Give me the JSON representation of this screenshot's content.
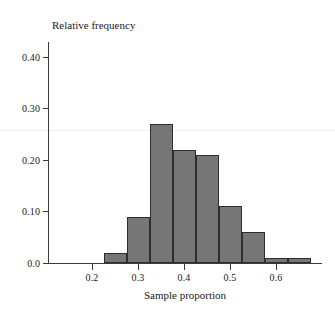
{
  "chart_data": {
    "type": "bar",
    "title": "",
    "subtitle": "",
    "xlabel": "Sample proportion",
    "ylabel": "Relative frequency",
    "xlim": [
      0.15,
      0.68
    ],
    "ylim": [
      0.0,
      0.43
    ],
    "grid": false,
    "legend": null,
    "bin_width": 0.05,
    "categories": [
      "0.225-0.275",
      "0.275-0.325",
      "0.325-0.375",
      "0.375-0.425",
      "0.425-0.475",
      "0.475-0.525",
      "0.525-0.575",
      "0.575-0.625",
      "0.625-0.675"
    ],
    "bin_starts": [
      0.225,
      0.275,
      0.325,
      0.375,
      0.425,
      0.475,
      0.525,
      0.575,
      0.625
    ],
    "bin_ends": [
      0.275,
      0.325,
      0.375,
      0.425,
      0.475,
      0.525,
      0.575,
      0.625,
      0.675
    ],
    "values": [
      0.02,
      0.09,
      0.27,
      0.22,
      0.21,
      0.11,
      0.06,
      0.01,
      0.01
    ],
    "x_ticks": [
      0.2,
      0.3,
      0.4,
      0.5,
      0.6
    ],
    "x_tick_labels": [
      "0.2",
      "0.3",
      "0.4",
      "0.5",
      "0.6"
    ],
    "y_ticks": [
      0.0,
      0.1,
      0.2,
      0.3,
      0.4
    ],
    "y_tick_labels": [
      "0.0",
      "0.10",
      "0.20",
      "0.30",
      "0.40"
    ],
    "bar_color": "#767676",
    "bar_edge_color": "#2e2e2e",
    "axis_color": "#3a3a3a",
    "background_color": "#ffffff"
  }
}
